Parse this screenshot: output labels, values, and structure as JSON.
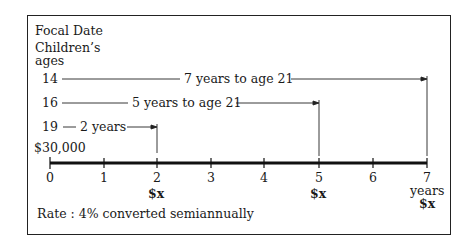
{
  "title": "Focal Date",
  "ages_label_line1": "Children’s",
  "ages_label_line2": "ages",
  "rows": [
    {
      "age": "14",
      "label": "7 years to age 21",
      "end_tick": 7
    },
    {
      "age": "16",
      "label": "5 years to age 21",
      "end_tick": 5
    },
    {
      "age": "19",
      "label": "2 years",
      "end_tick": 2
    }
  ],
  "initial_amount": "$30,000",
  "axis": {
    "ticks": [
      "0",
      "1",
      "2",
      "3",
      "4",
      "5",
      "6",
      "7"
    ],
    "unit": "years"
  },
  "payments": [
    {
      "at": "2",
      "label": "$x"
    },
    {
      "at": "5",
      "label": "$x"
    },
    {
      "at": "7",
      "label": "$x"
    }
  ],
  "rate": "Rate : 4% converted semiannually"
}
